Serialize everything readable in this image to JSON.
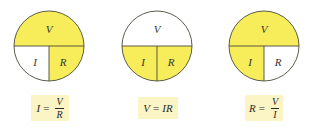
{
  "colors": {
    "filled": "#F7EC5A",
    "empty": "#FFFFFF",
    "stroke": "#4a4a3a",
    "formula_bg": "#FBF5C6"
  },
  "panels": [
    {
      "circle": {
        "top": "V",
        "bottom_left": "I",
        "bottom_right": "R",
        "filled": [
          "top",
          "bottom_right"
        ]
      },
      "formula": {
        "lhs": "I",
        "eq": "=",
        "num": "V",
        "den": "R"
      }
    },
    {
      "circle": {
        "top": "V",
        "bottom_left": "I",
        "bottom_right": "R",
        "filled": [
          "bottom_left",
          "bottom_right"
        ]
      },
      "formula": {
        "lhs": "V",
        "eq": "=",
        "rhs": "IR"
      }
    },
    {
      "circle": {
        "top": "V",
        "bottom_left": "I",
        "bottom_right": "R",
        "filled": [
          "top",
          "bottom_left"
        ]
      },
      "formula": {
        "lhs": "R",
        "eq": "=",
        "num": "V",
        "den": "I"
      }
    }
  ]
}
